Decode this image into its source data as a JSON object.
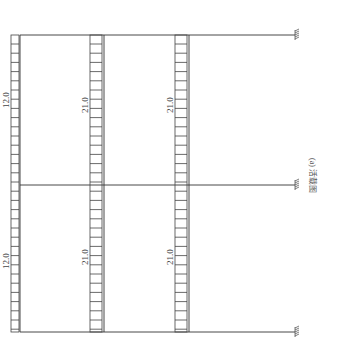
{
  "diagram": {
    "type": "frame-load-diagram",
    "caption": "(a) 活载图",
    "load_labels": [
      {
        "id": "left-upper",
        "value": "12.0"
      },
      {
        "id": "left-lower",
        "value": "12.0"
      },
      {
        "id": "mid-upper",
        "value": "21.0"
      },
      {
        "id": "mid-lower",
        "value": "21.0"
      },
      {
        "id": "right-upper",
        "value": "21.0"
      },
      {
        "id": "right-lower",
        "value": "21.0"
      }
    ],
    "supports": [
      "fixed",
      "fixed",
      "fixed"
    ],
    "colors": {
      "line": "#333333",
      "hatch": "#444444",
      "text": "#444444"
    }
  }
}
